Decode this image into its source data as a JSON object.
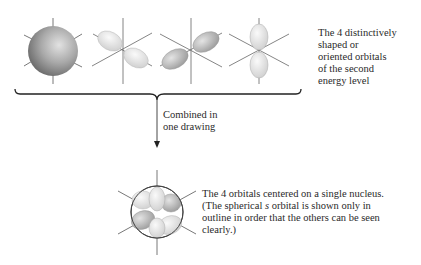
{
  "figure": {
    "top_caption": "The 4 distinctively\nshaped or\noriented orbitals\nof the second\nenergy level",
    "middle_caption": "Combined in\none drawing",
    "bottom_caption_part1": "The 4 orbitals centered on a single nucleus.\n(The spherical ",
    "bottom_caption_italic": "s",
    "bottom_caption_part2": " orbital is shown only in\noutline in order that the others can be seen\nclearly.)",
    "orbitals": [
      {
        "name": "s-orbital",
        "shape": "sphere"
      },
      {
        "name": "p-orbital-x",
        "shape": "dumbbell"
      },
      {
        "name": "p-orbital-y",
        "shape": "dumbbell"
      },
      {
        "name": "p-orbital-z",
        "shape": "dumbbell"
      }
    ],
    "combined": {
      "name": "combined-orbitals",
      "shape": "sphere-outline-with-lobes"
    },
    "colors": {
      "sphere_dark": "#7a7a7a",
      "sphere_light": "#e0e0e0",
      "lobe_light": "#e6e6e6",
      "lobe_mid": "#bdbdbd",
      "axis": "#555555",
      "text": "#2a2a2a"
    }
  }
}
